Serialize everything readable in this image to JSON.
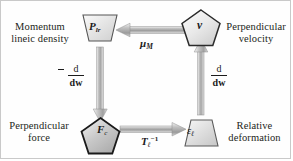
{
  "diagram": {
    "type": "cycle-diagram",
    "title_visible": false,
    "border_color": "#c9c9c9",
    "background": "#ffffff",
    "nodes": [
      {
        "id": "momentum",
        "shape": "trapezoid",
        "symbol": "P",
        "symbol_subscript": "lr",
        "label_line1": "Momentum",
        "label_line2": "lineic density",
        "label_position": "left",
        "fill": "#e8e8e8"
      },
      {
        "id": "velocity",
        "shape": "pentagon",
        "symbol": "v",
        "symbol_subscript": "",
        "label_line1": "Perpendicular",
        "label_line2": "velocity",
        "label_position": "right",
        "fill": "#e4e4e4"
      },
      {
        "id": "force",
        "shape": "pentagon",
        "symbol": "F",
        "symbol_subscript": "c",
        "label_line1": "Perpendicular",
        "label_line2": "force",
        "label_position": "left",
        "fill": "#c8c8c8"
      },
      {
        "id": "deformation",
        "shape": "trapezoid",
        "symbol": "ε",
        "symbol_subscript": "ℓ",
        "label_line1": "Relative",
        "label_line2": "deformation",
        "label_position": "right",
        "fill": "#dedede"
      }
    ],
    "edges": [
      {
        "id": "edge-top",
        "from": "velocity",
        "to": "momentum",
        "direction": "left",
        "label_symbol": "μ",
        "label_subscript": "M",
        "label_superscript": "",
        "style": "3d-gradient-arrow"
      },
      {
        "id": "edge-left",
        "from": "momentum",
        "to": "force",
        "direction": "down",
        "label_sign": "−",
        "label_numerator": "d",
        "label_denominator": "dw",
        "style": "3d-gradient-arrow"
      },
      {
        "id": "edge-bottom",
        "from": "force",
        "to": "deformation",
        "direction": "right",
        "label_symbol": "T",
        "label_subscript": "ℓ",
        "label_superscript": "−1",
        "style": "3d-gradient-arrow"
      },
      {
        "id": "edge-right",
        "from": "deformation",
        "to": "velocity",
        "direction": "up",
        "label_sign": "",
        "label_numerator": "d",
        "label_denominator": "dw",
        "style": "3d-gradient-arrow"
      }
    ]
  }
}
